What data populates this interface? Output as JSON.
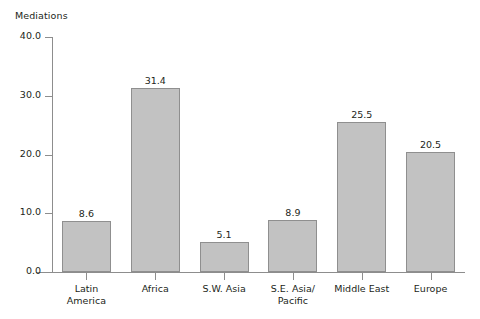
{
  "chart_data": {
    "type": "bar",
    "title": "",
    "xlabel": "",
    "ylabel": "Mediations",
    "ylim": [
      0.0,
      40.0
    ],
    "ytick_labels": [
      "0.0",
      "10.0",
      "20.0",
      "30.0",
      "40.0"
    ],
    "ytick_values": [
      0.0,
      10.0,
      20.0,
      30.0,
      40.0
    ],
    "grid": false,
    "legend": "none",
    "bar_color": "#c2c2c2",
    "bar_border_color": "#8f8f8f",
    "axis_color": "#8d8d8d",
    "categories": [
      "Latin\nAmerica",
      "Africa",
      "S.W. Asia",
      "S.E. Asia/\nPacific",
      "Middle East",
      "Europe"
    ],
    "values": [
      8.6,
      31.4,
      5.1,
      8.9,
      25.5,
      20.5
    ],
    "value_labels": [
      "8.6",
      "31.4",
      "5.1",
      "8.9",
      "25.5",
      "20.5"
    ]
  },
  "partial_title": "figure caption cut off at top edge"
}
